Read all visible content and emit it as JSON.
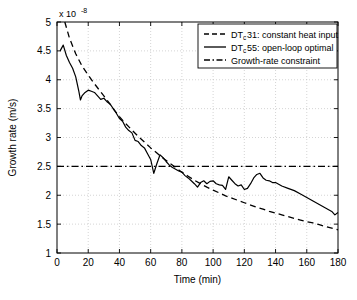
{
  "chart_data": {
    "type": "line",
    "title": "",
    "xlabel": "Time (min)",
    "ylabel": "Growth rate (m/s)",
    "y_exponent_label": "x 10",
    "y_exponent_value": "-8",
    "xlim": [
      0,
      180
    ],
    "ylim": [
      1,
      5
    ],
    "xticks": [
      0,
      20,
      40,
      60,
      80,
      100,
      120,
      140,
      160,
      180
    ],
    "yticks": [
      1,
      1.5,
      2,
      2.5,
      3,
      3.5,
      4,
      4.5,
      5
    ],
    "xtick_labels": [
      "0",
      "20",
      "40",
      "60",
      "80",
      "100",
      "120",
      "140",
      "160",
      "180"
    ],
    "ytick_labels": [
      "1",
      "1.5",
      "2",
      "2.5",
      "3",
      "3.5",
      "4",
      "4.5",
      "5"
    ],
    "grid": true,
    "grid_style": "dotted",
    "legend_position": "top-right",
    "series": [
      {
        "name": "DT_c31: constant heat input",
        "legend_label_prefix": "DT",
        "legend_label_subscript": "c",
        "legend_label_suffix": "31: constant heat input",
        "style": "dashed",
        "color": "#000000",
        "x": [
          5,
          8,
          12,
          16,
          20,
          24,
          28,
          32,
          36,
          40,
          44,
          48,
          52,
          56,
          60,
          64,
          68,
          72,
          76,
          80,
          84,
          88,
          92,
          96,
          100,
          104,
          108,
          112,
          116,
          120,
          124,
          128,
          132,
          136,
          140,
          144,
          148,
          152,
          156,
          160,
          164,
          168,
          172,
          176,
          180
        ],
        "y": [
          5.0,
          4.72,
          4.45,
          4.24,
          4.08,
          3.93,
          3.79,
          3.65,
          3.5,
          3.36,
          3.24,
          3.13,
          3.02,
          2.92,
          2.82,
          2.73,
          2.64,
          2.56,
          2.48,
          2.4,
          2.33,
          2.26,
          2.2,
          2.14,
          2.09,
          2.04,
          1.99,
          1.95,
          1.91,
          1.87,
          1.83,
          1.79,
          1.76,
          1.72,
          1.69,
          1.66,
          1.63,
          1.6,
          1.57,
          1.54,
          1.52,
          1.49,
          1.46,
          1.43,
          1.4
        ]
      },
      {
        "name": "DT_c55: open-loop optimal",
        "legend_label_prefix": "DT",
        "legend_label_subscript": "c",
        "legend_label_suffix": "55: open-loop optimal",
        "style": "solid",
        "color": "#000000",
        "x": [
          2,
          4,
          6,
          8,
          10,
          12,
          14,
          15,
          16,
          18,
          20,
          22,
          24,
          26,
          28,
          30,
          32,
          34,
          36,
          38,
          40,
          42,
          44,
          46,
          48,
          50,
          52,
          54,
          56,
          58,
          60,
          62,
          64,
          66,
          68,
          70,
          72,
          74,
          76,
          78,
          80,
          82,
          84,
          86,
          88,
          90,
          92,
          94,
          96,
          98,
          100,
          102,
          104,
          106,
          108,
          110,
          112,
          114,
          116,
          118,
          120,
          122,
          124,
          126,
          128,
          130,
          132,
          134,
          136,
          138,
          140,
          144,
          148,
          152,
          156,
          160,
          164,
          168,
          172,
          176,
          178,
          180
        ],
        "y": [
          4.5,
          4.6,
          4.42,
          4.3,
          4.2,
          4.05,
          3.8,
          3.65,
          3.72,
          3.78,
          3.82,
          3.8,
          3.78,
          3.72,
          3.66,
          3.68,
          3.62,
          3.58,
          3.5,
          3.42,
          3.33,
          3.28,
          3.18,
          3.12,
          3.08,
          2.95,
          2.93,
          2.86,
          2.82,
          2.72,
          2.62,
          2.38,
          2.55,
          2.7,
          2.65,
          2.58,
          2.52,
          2.48,
          2.45,
          2.42,
          2.4,
          2.34,
          2.3,
          2.25,
          2.2,
          2.14,
          2.22,
          2.25,
          2.2,
          2.24,
          2.25,
          2.2,
          2.18,
          2.17,
          2.1,
          2.32,
          2.26,
          2.2,
          2.16,
          2.18,
          2.1,
          2.12,
          2.2,
          2.3,
          2.36,
          2.38,
          2.3,
          2.26,
          2.25,
          2.22,
          2.22,
          2.16,
          2.12,
          2.08,
          2.02,
          1.96,
          1.9,
          1.84,
          1.78,
          1.72,
          1.66,
          1.7
        ]
      },
      {
        "name": "Growth-rate constraint",
        "legend_label_prefix": "",
        "legend_label_subscript": "",
        "legend_label_suffix": "Growth-rate constraint",
        "style": "dash-dot",
        "color": "#000000",
        "constant_value": 2.5,
        "x": [
          0,
          180
        ],
        "y": [
          2.5,
          2.5
        ]
      }
    ]
  }
}
